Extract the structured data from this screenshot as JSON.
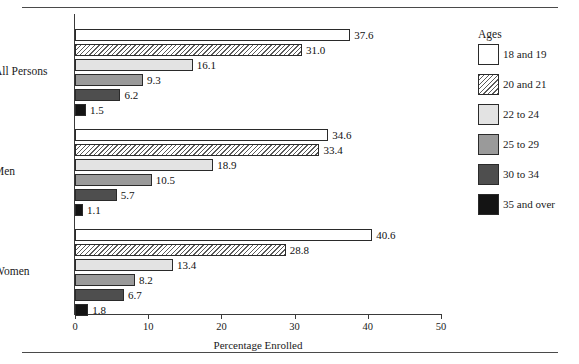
{
  "figure": {
    "cropped_caption": "",
    "xlabel": "Percentage Enrolled"
  },
  "legend": {
    "title": "Ages",
    "items": [
      {
        "label": "18 and 19",
        "swatch": "white-open-square-swatch"
      },
      {
        "label": "20 and 21",
        "swatch": "diagonal-hatch-square-swatch"
      },
      {
        "label": "22 to 24",
        "swatch": "light-gray-square-swatch"
      },
      {
        "label": "25 to 29",
        "swatch": "medium-gray-square-swatch"
      },
      {
        "label": "30 to 34",
        "swatch": "dark-gray-square-swatch"
      },
      {
        "label": "35 and over",
        "swatch": "black-square-swatch"
      }
    ]
  },
  "axis": {
    "ticks": [
      "0",
      "10",
      "20",
      "30",
      "40",
      "50"
    ]
  },
  "groups": [
    {
      "label": "All Persons",
      "values": [
        "37.6",
        "31.0",
        "16.1",
        "9.3",
        "6.2",
        "1.5"
      ]
    },
    {
      "label": "Men",
      "values": [
        "34.6",
        "33.4",
        "18.9",
        "10.5",
        "5.7",
        "1.1"
      ]
    },
    {
      "label": "Women",
      "values": [
        "40.6",
        "28.8",
        "13.4",
        "8.2",
        "6.7",
        "1.8"
      ]
    }
  ],
  "chart_data": {
    "type": "bar",
    "orientation": "horizontal",
    "title": "",
    "xlabel": "Percentage Enrolled",
    "ylabel": "",
    "xlim": [
      0,
      50
    ],
    "xticks": [
      0,
      10,
      20,
      30,
      40,
      50
    ],
    "grid": false,
    "legend_title": "Ages",
    "legend_position": "right",
    "categories": [
      "All Persons",
      "Men",
      "Women"
    ],
    "series": [
      {
        "name": "18 and 19",
        "values": [
          37.6,
          34.6,
          40.6
        ],
        "color": "#ffffff",
        "pattern": "solid"
      },
      {
        "name": "20 and 21",
        "values": [
          31.0,
          33.4,
          28.8
        ],
        "color": "#ffffff",
        "pattern": "diagonal-hatch"
      },
      {
        "name": "22 to 24",
        "values": [
          16.1,
          18.9,
          13.4
        ],
        "color": "#e3e3e3",
        "pattern": "solid"
      },
      {
        "name": "25 to 29",
        "values": [
          9.3,
          10.5,
          8.2
        ],
        "color": "#9a9a9a",
        "pattern": "solid"
      },
      {
        "name": "30 to 34",
        "values": [
          6.2,
          5.7,
          6.7
        ],
        "color": "#4e4e4e",
        "pattern": "solid"
      },
      {
        "name": "35 and over",
        "values": [
          1.5,
          1.1,
          1.8
        ],
        "color": "#141414",
        "pattern": "solid"
      }
    ],
    "data_labels": true
  }
}
